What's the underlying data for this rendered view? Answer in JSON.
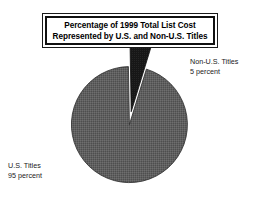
{
  "figure": {
    "title_line_1": "Percentage of 1999 Total List Cost",
    "title_line_2": "Represented by U.S. and Non-U.S. Titles"
  },
  "labels": {
    "non_us": {
      "name": "Non-U.S. Titles",
      "value": "5 percent"
    },
    "us": {
      "name": "U.S. Titles",
      "value": "95 percent"
    }
  },
  "colors": {
    "us_slice": "#5f5f5f",
    "non_us_slice": "#171717",
    "outline": "#111111",
    "background": "#ffffff",
    "text": "#1a1a1a"
  },
  "chart_data": {
    "type": "pie",
    "title": "Percentage of 1999 Total List Cost Represented by U.S. and Non-U.S. Titles",
    "xlabel": "",
    "ylabel": "",
    "units": "percent",
    "legend_position": "callout-labels",
    "grid": false,
    "categories": [
      "U.S. Titles",
      "Non-U.S. Titles"
    ],
    "values": [
      95,
      5
    ],
    "slices": [
      {
        "label": "U.S. Titles",
        "value": 95,
        "value_text": "95 percent",
        "color": "#5f5f5f",
        "exploded": false
      },
      {
        "label": "Non-U.S. Titles",
        "value": 5,
        "value_text": "5 percent",
        "color": "#171717",
        "exploded": true
      }
    ]
  }
}
